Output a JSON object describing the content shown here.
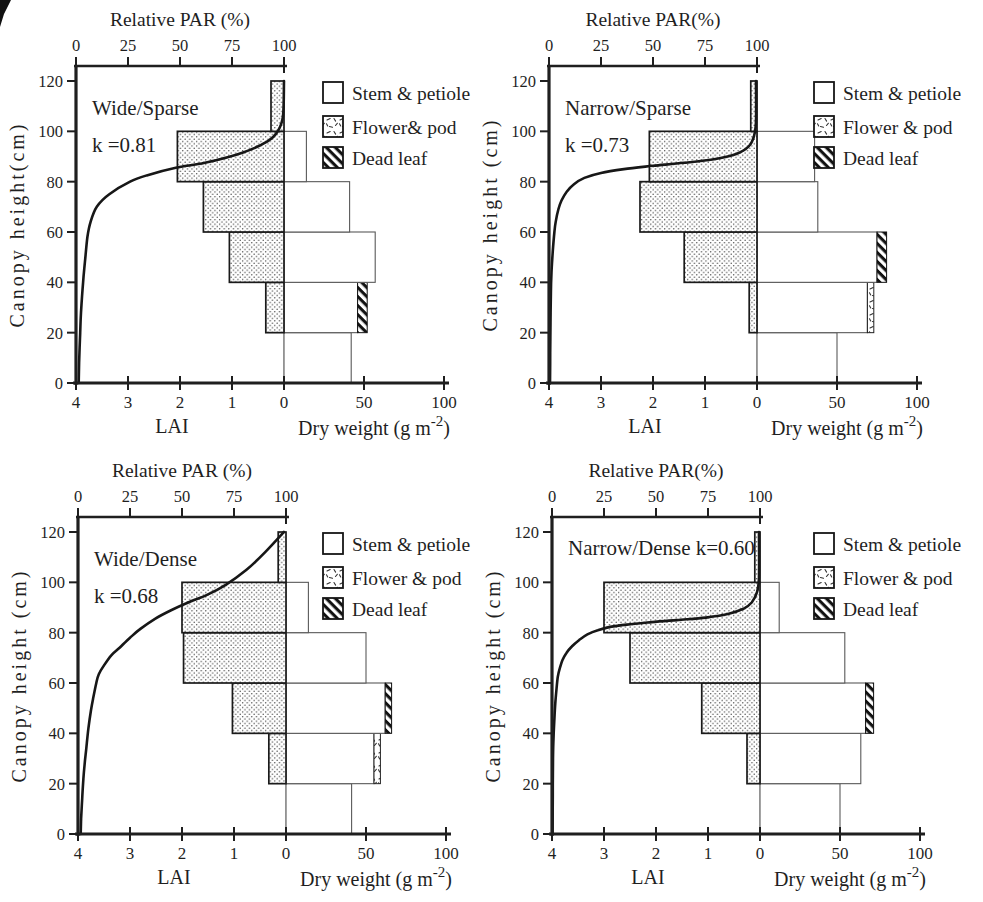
{
  "figure": {
    "background": "#ffffff",
    "ink": "#1f1f1f",
    "grid_color": "#b3b3b3",
    "stipple_color": "#3f3f3f",
    "stem_fill": "#ffffff",
    "hatch_color": "#121212"
  },
  "chart_data": {
    "type": "bar",
    "subtype": "canopy-production-structure-profiles",
    "orientation": "horizontal",
    "units": {
      "height": "cm",
      "par": "%",
      "dry_weight": "g m-2",
      "leaf_area": "LAI"
    },
    "shared_axes": {
      "par_ticks": [
        "0",
        "25",
        "50",
        "75",
        "100"
      ],
      "par_tick_values": [
        0,
        25,
        50,
        75,
        100
      ],
      "height_ticks": [
        "120",
        "100",
        "80",
        "60",
        "40",
        "20",
        "0"
      ],
      "height_tick_values": [
        120,
        100,
        80,
        60,
        40,
        20,
        0
      ],
      "lai_ticks": [
        "4",
        "3",
        "2",
        "1",
        "0"
      ],
      "lai_tick_values": [
        4,
        3,
        2,
        1,
        0
      ],
      "dw_ticks": [
        "50",
        "100"
      ],
      "dw_tick_values": [
        50,
        100
      ],
      "height_range": [
        0,
        120
      ],
      "par_range": [
        0,
        100
      ],
      "lai_range": [
        4,
        0
      ],
      "dw_range": [
        0,
        100
      ],
      "lai_axis_label": "LAI",
      "dw_label_main": "Dry weight (g m",
      "dw_label_sup": "-2",
      "dw_label_close": ")"
    },
    "panels": [
      {
        "name": "wide-sparse",
        "par_axis_title": "Relative PAR (%)",
        "y_axis_label": "Canopy height(cm)",
        "title_lines": [
          "Wide/Sparse",
          "k =0.81"
        ],
        "k": 0.81,
        "legend": [
          {
            "label": "Stem & petiole",
            "pattern": "open"
          },
          {
            "label": "Flower& pod",
            "pattern": "sparse"
          },
          {
            "label": "Dead leaf",
            "pattern": "hatch"
          }
        ],
        "layers": [
          {
            "height_range": [
              0,
              20
            ],
            "lai": 0,
            "stem": 42,
            "flower": 0,
            "dead": 0
          },
          {
            "height_range": [
              20,
              40
            ],
            "lai": 0.35,
            "stem": 46,
            "flower": 0,
            "dead": 6
          },
          {
            "height_range": [
              40,
              60
            ],
            "lai": 1.05,
            "stem": 57,
            "flower": 0,
            "dead": 0
          },
          {
            "height_range": [
              60,
              80
            ],
            "lai": 1.55,
            "stem": 41,
            "flower": 0,
            "dead": 0
          },
          {
            "height_range": [
              80,
              100
            ],
            "lai": 2.05,
            "stem": 14,
            "flower": 0,
            "dead": 0
          },
          {
            "height_range": [
              100,
              120
            ],
            "lai": 0.25,
            "stem": 0,
            "flower": 0,
            "dead": 0
          }
        ],
        "par_profile": [
          [
            100,
            120
          ],
          [
            99.5,
            106
          ],
          [
            97,
            100
          ],
          [
            92,
            96
          ],
          [
            80,
            91.5
          ],
          [
            62,
            87.5
          ],
          [
            48,
            85.5
          ],
          [
            34,
            82.5
          ],
          [
            26,
            80
          ],
          [
            16,
            75
          ],
          [
            10,
            70
          ],
          [
            7,
            64
          ],
          [
            5.5,
            58
          ],
          [
            4.3,
            48
          ],
          [
            3.4,
            40
          ],
          [
            2.4,
            28
          ],
          [
            2,
            20
          ],
          [
            1.5,
            8
          ],
          [
            1.3,
            0
          ]
        ]
      },
      {
        "name": "narrow-sparse",
        "par_axis_title": "Relative PAR(%)",
        "y_axis_label": "Canopy height (cm)",
        "title_lines": [
          "Narrow/Sparse",
          "k =0.73"
        ],
        "k": 0.73,
        "legend": [
          {
            "label": "Stem & petiole",
            "pattern": "open"
          },
          {
            "label": "Flower & pod",
            "pattern": "sparse"
          },
          {
            "label": "Dead leaf",
            "pattern": "hatch"
          }
        ],
        "layers": [
          {
            "height_range": [
              0,
              20
            ],
            "lai": 0,
            "stem": 50,
            "flower": 0,
            "dead": 0
          },
          {
            "height_range": [
              20,
              40
            ],
            "lai": 0.15,
            "stem": 69,
            "flower": 4,
            "dead": 0
          },
          {
            "height_range": [
              40,
              60
            ],
            "lai": 1.4,
            "stem": 75,
            "flower": 0,
            "dead": 6
          },
          {
            "height_range": [
              60,
              80
            ],
            "lai": 2.25,
            "stem": 38,
            "flower": 0,
            "dead": 0
          },
          {
            "height_range": [
              80,
              100
            ],
            "lai": 2.07,
            "stem": 36,
            "flower": 0,
            "dead": 0
          },
          {
            "height_range": [
              100,
              120
            ],
            "lai": 0.12,
            "stem": 0,
            "flower": 0,
            "dead": 0
          }
        ],
        "par_profile": [
          [
            99.5,
            120
          ],
          [
            99.5,
            104
          ],
          [
            98.5,
            98
          ],
          [
            96,
            94
          ],
          [
            90,
            91
          ],
          [
            80,
            89
          ],
          [
            65,
            87.5
          ],
          [
            50,
            86.3
          ],
          [
            36,
            85
          ],
          [
            25,
            83.5
          ],
          [
            17,
            81.5
          ],
          [
            12,
            79
          ],
          [
            8.5,
            76
          ],
          [
            6,
            72.5
          ],
          [
            4.5,
            69
          ],
          [
            3.2,
            64
          ],
          [
            2.6,
            60
          ],
          [
            1.8,
            52
          ],
          [
            1.2,
            44
          ],
          [
            0.9,
            36
          ],
          [
            0.7,
            24
          ],
          [
            0.6,
            12
          ],
          [
            0.5,
            0
          ]
        ]
      },
      {
        "name": "wide-dense",
        "par_axis_title": "Relative PAR (%)",
        "y_axis_label": "Canopy height (cm)",
        "title_lines": [
          "Wide/Dense",
          "k =0.68"
        ],
        "k": 0.68,
        "legend": [
          {
            "label": "Stem & petiole",
            "pattern": "open"
          },
          {
            "label": "Flower & pod",
            "pattern": "sparse"
          },
          {
            "label": "Dead leaf",
            "pattern": "hatch"
          }
        ],
        "layers": [
          {
            "height_range": [
              0,
              20
            ],
            "lai": 0,
            "stem": 41,
            "flower": 0,
            "dead": 0
          },
          {
            "height_range": [
              20,
              40
            ],
            "lai": 0.33,
            "stem": 55,
            "flower": 4,
            "dead": 0
          },
          {
            "height_range": [
              40,
              60
            ],
            "lai": 1.03,
            "stem": 62,
            "flower": 0,
            "dead": 4
          },
          {
            "height_range": [
              60,
              80
            ],
            "lai": 1.97,
            "stem": 50,
            "flower": 0,
            "dead": 0
          },
          {
            "height_range": [
              80,
              100
            ],
            "lai": 2.0,
            "stem": 14,
            "flower": 0,
            "dead": 0
          },
          {
            "height_range": [
              100,
              120
            ],
            "lai": 0.15,
            "stem": 0,
            "flower": 0,
            "dead": 0
          }
        ],
        "par_profile": [
          [
            99,
            120
          ],
          [
            90,
            112
          ],
          [
            81,
            105
          ],
          [
            71,
            99
          ],
          [
            62,
            95
          ],
          [
            53,
            92
          ],
          [
            45,
            89
          ],
          [
            37,
            85.5
          ],
          [
            30,
            81.5
          ],
          [
            25,
            78
          ],
          [
            20,
            74
          ],
          [
            16,
            71
          ],
          [
            12.5,
            67
          ],
          [
            10,
            63.5
          ],
          [
            8.8,
            60
          ],
          [
            7.3,
            54
          ],
          [
            6.2,
            49
          ],
          [
            5,
            42
          ],
          [
            4,
            34
          ],
          [
            3.2,
            28
          ],
          [
            2.6,
            22
          ],
          [
            2,
            14
          ],
          [
            1.5,
            6
          ],
          [
            1.3,
            0
          ]
        ]
      },
      {
        "name": "narrow-dense",
        "par_axis_title": "Relative PAR(%)",
        "y_axis_label": "Canopy height (cm)",
        "title_lines": [
          "Narrow/Dense k=0.60"
        ],
        "k": 0.6,
        "legend": [
          {
            "label": "Stem & petiole",
            "pattern": "open"
          },
          {
            "label": "Flower & pod",
            "pattern": "sparse"
          },
          {
            "label": "Dead leaf",
            "pattern": "hatch"
          }
        ],
        "layers": [
          {
            "height_range": [
              0,
              20
            ],
            "lai": 0,
            "stem": 50,
            "flower": 0,
            "dead": 0
          },
          {
            "height_range": [
              20,
              40
            ],
            "lai": 0.25,
            "stem": 63,
            "flower": 0,
            "dead": 0
          },
          {
            "height_range": [
              40,
              60
            ],
            "lai": 1.12,
            "stem": 66,
            "flower": 0,
            "dead": 5
          },
          {
            "height_range": [
              60,
              80
            ],
            "lai": 2.5,
            "stem": 53,
            "flower": 0,
            "dead": 0
          },
          {
            "height_range": [
              80,
              100
            ],
            "lai": 3.0,
            "stem": 12,
            "flower": 0,
            "dead": 0
          },
          {
            "height_range": [
              100,
              120
            ],
            "lai": 0.1,
            "stem": 0,
            "flower": 0,
            "dead": 0
          }
        ],
        "par_profile": [
          [
            99.5,
            120
          ],
          [
            99.5,
            102
          ],
          [
            98.5,
            96
          ],
          [
            96,
            92
          ],
          [
            92,
            89.5
          ],
          [
            85,
            87.5
          ],
          [
            74,
            86
          ],
          [
            60,
            85
          ],
          [
            48,
            84.2
          ],
          [
            36,
            83.2
          ],
          [
            28,
            82.3
          ],
          [
            22,
            81
          ],
          [
            17,
            79.3
          ],
          [
            13,
            77
          ],
          [
            9.5,
            74.5
          ],
          [
            7,
            72
          ],
          [
            5,
            69
          ],
          [
            3.8,
            66
          ],
          [
            2.8,
            62.5
          ],
          [
            2.2,
            58
          ],
          [
            1.6,
            52
          ],
          [
            1.1,
            45
          ],
          [
            0.7,
            38
          ],
          [
            0.5,
            30
          ],
          [
            0.4,
            20
          ],
          [
            0.35,
            10
          ],
          [
            0.3,
            0
          ]
        ]
      }
    ]
  }
}
